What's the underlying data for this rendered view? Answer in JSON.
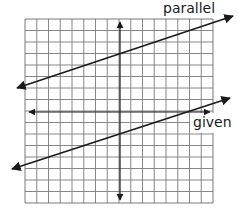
{
  "diagram": {
    "type": "coordinate-grid-lines",
    "grid": {
      "x": 25,
      "y": 19,
      "cols": 16,
      "rows": 16,
      "cell_w": 11.75,
      "cell_h": 11.5,
      "line_color": "#7a7a7a",
      "border_color": "#6a6a6a"
    },
    "cutout": {
      "x": 190,
      "y": 113,
      "w": 24,
      "h": 20
    },
    "lines": [
      {
        "name": "parallel-line",
        "x1": 17,
        "y1": 88,
        "x2": 233,
        "y2": 16,
        "color": "#1a1a1a",
        "width": 1.6
      },
      {
        "name": "given-line",
        "x1": 12,
        "y1": 169,
        "x2": 230,
        "y2": 98,
        "color": "#1a1a1a",
        "width": 1.6
      },
      {
        "name": "horizontal-axis",
        "x1": 29,
        "y1": 112,
        "x2": 210,
        "y2": 112,
        "color": "#1a1a1a",
        "width": 1.2
      },
      {
        "name": "vertical-axis",
        "x1": 120,
        "y1": 22,
        "x2": 120,
        "y2": 200,
        "color": "#1a1a1a",
        "width": 1.2
      }
    ],
    "labels": {
      "parallel": "parallel",
      "given": "given"
    }
  }
}
